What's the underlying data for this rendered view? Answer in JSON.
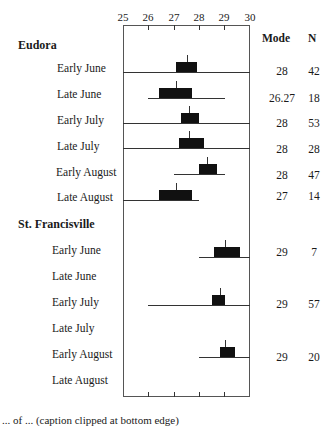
{
  "chart_data": {
    "type": "boxplot",
    "title": "",
    "xlabel": "",
    "xlim": [
      25,
      30
    ],
    "x_ticks": [
      "25",
      "26",
      "27",
      "28",
      "29",
      "30"
    ],
    "columns": {
      "mode": "Mode",
      "n": "N"
    },
    "groups": [
      {
        "name": "Eudora",
        "rows": [
          {
            "label": "Early June",
            "whisker_min": 25.0,
            "q1": 27.1,
            "median": 27.5,
            "q3": 27.9,
            "whisker_max": 30.0,
            "mode": "28",
            "n": "42"
          },
          {
            "label": "Late June",
            "whisker_min": 26.0,
            "q1": 26.4,
            "median": 27.1,
            "q3": 27.7,
            "whisker_max": 29.0,
            "mode": "26.27",
            "n": "18"
          },
          {
            "label": "Early July",
            "whisker_min": 25.0,
            "q1": 27.3,
            "median": 27.6,
            "q3": 28.0,
            "whisker_max": 30.0,
            "mode": "28",
            "n": "53"
          },
          {
            "label": "Late July",
            "whisker_min": 25.0,
            "q1": 27.2,
            "median": 27.6,
            "q3": 28.2,
            "whisker_max": 30.0,
            "mode": "28",
            "n": "28"
          },
          {
            "label": "Early August",
            "whisker_min": 27.0,
            "q1": 28.0,
            "median": 28.3,
            "q3": 28.7,
            "whisker_max": 29.0,
            "mode": "28",
            "n": "47"
          },
          {
            "label": "Late August",
            "whisker_min": 25.0,
            "q1": 26.4,
            "median": 27.1,
            "q3": 27.7,
            "whisker_max": 28.0,
            "mode": "27",
            "n": "14"
          }
        ]
      },
      {
        "name": "St. Francisville",
        "rows": [
          {
            "label": "Early June",
            "whisker_min": 28.0,
            "q1": 28.6,
            "median": 29.0,
            "q3": 29.6,
            "whisker_max": 30.0,
            "mode": "29",
            "n": "7"
          },
          {
            "label": "Late June",
            "mode": "",
            "n": ""
          },
          {
            "label": "Early July",
            "whisker_min": 26.0,
            "q1": 28.5,
            "median": 28.8,
            "q3": 29.0,
            "whisker_max": 30.0,
            "mode": "29",
            "n": "57"
          },
          {
            "label": "Late July",
            "mode": "",
            "n": ""
          },
          {
            "label": "Early August",
            "whisker_min": 28.0,
            "q1": 28.8,
            "median": 29.0,
            "q3": 29.4,
            "whisker_max": 30.0,
            "mode": "29",
            "n": "20"
          },
          {
            "label": "Late August",
            "mode": "",
            "n": ""
          }
        ]
      }
    ],
    "grid": false,
    "legend": "none"
  },
  "caption": "... of ... (caption clipped at bottom edge)"
}
